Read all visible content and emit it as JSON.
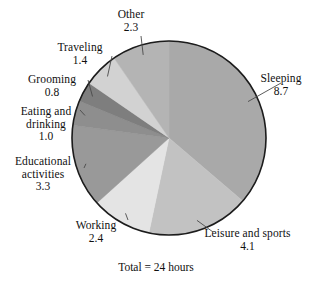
{
  "chart_data": {
    "type": "pie",
    "title": "",
    "subtitle": "",
    "caption": "Total = 24 hours",
    "unit": "hours",
    "total": 24,
    "legend_position": "none",
    "labels_position": "outside-with-leader-lines",
    "start_angle_deg": 0,
    "direction": "clockwise",
    "categories": [
      "Sleeping",
      "Leisure and sports",
      "Working",
      "Educational activities",
      "Eating and drinking",
      "Grooming",
      "Traveling",
      "Other"
    ],
    "values": [
      8.7,
      4.1,
      2.4,
      3.3,
      1.0,
      0.8,
      1.4,
      2.3
    ],
    "slices": [
      {
        "label": "Sleeping",
        "label_lines": [
          "Sleeping"
        ],
        "value": "8.7",
        "value_num": 8.7,
        "color": "#a9a9a9"
      },
      {
        "label": "Leisure and sports",
        "label_lines": [
          "Leisure and sports"
        ],
        "value": "4.1",
        "value_num": 4.1,
        "color": "#c2c2c2"
      },
      {
        "label": "Working",
        "label_lines": [
          "Working"
        ],
        "value": "2.4",
        "value_num": 2.4,
        "color": "#e4e4e4"
      },
      {
        "label": "Educational activities",
        "label_lines": [
          "Educational",
          "activities"
        ],
        "value": "3.3",
        "value_num": 3.3,
        "color": "#999999"
      },
      {
        "label": "Eating and drinking",
        "label_lines": [
          "Eating and",
          "drinking"
        ],
        "value": "1.0",
        "value_num": 1.0,
        "color": "#8e8e8e"
      },
      {
        "label": "Grooming",
        "label_lines": [
          "Grooming"
        ],
        "value": "0.8",
        "value_num": 0.8,
        "color": "#7e7e7e"
      },
      {
        "label": "Traveling",
        "label_lines": [
          "Traveling"
        ],
        "value": "1.4",
        "value_num": 1.4,
        "color": "#d2d2d2"
      },
      {
        "label": "Other",
        "label_lines": [
          "Other"
        ],
        "value": "2.3",
        "value_num": 2.3,
        "color": "#b4b4b4"
      }
    ],
    "geometry": {
      "center_x": 169,
      "center_y": 138,
      "radius": 97
    },
    "colors": {
      "outline": "#1c1c1c",
      "leader_line": "#4a4a4a",
      "background": "#ffffff",
      "text": "#101010"
    }
  }
}
